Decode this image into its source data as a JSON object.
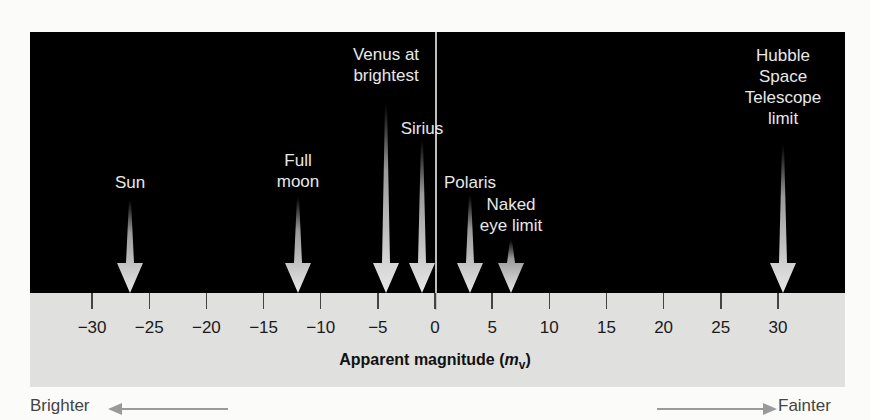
{
  "chart_data": {
    "type": "scatter",
    "title": "",
    "xlabel": "Apparent magnitude (m_v)",
    "ylabel": "",
    "xlim": [
      -33,
      35
    ],
    "ticks": [
      -30,
      -25,
      -20,
      -15,
      -10,
      -5,
      0,
      5,
      10,
      15,
      20,
      25,
      30
    ],
    "tick_labels": [
      "−30",
      "−25",
      "−20",
      "−15",
      "−10",
      "−5",
      "0",
      "5",
      "10",
      "15",
      "20",
      "25",
      "30"
    ],
    "grid": false,
    "points": [
      {
        "name": "Sun",
        "x": -26.7
      },
      {
        "name": "Full moon",
        "x": -12.6
      },
      {
        "name": "Venus at brightest",
        "x": -4.4
      },
      {
        "name": "Sirius",
        "x": -1.4
      },
      {
        "name": "Polaris",
        "x": 2.0
      },
      {
        "name": "Naked eye limit",
        "x": 6.0
      },
      {
        "name": "Hubble Space Telescope limit",
        "x": 30.0
      }
    ],
    "annotations": [
      "Brighter",
      "Fainter"
    ]
  },
  "axis": {
    "title": "Apparent magnitude (",
    "title_var": "m",
    "title_sub": "v",
    "title_end": ")"
  },
  "objects": [
    {
      "label": "Sun",
      "x_px": 130,
      "label_top": 172,
      "arrow_top": 200,
      "arrow_len": 93
    },
    {
      "label": "Full\nmoon",
      "x_px": 298,
      "label_top": 150,
      "arrow_top": 197,
      "arrow_len": 96
    },
    {
      "label": "Venus at\nbrightest",
      "x_px": 386,
      "label_top": 44,
      "arrow_top": 104,
      "arrow_len": 189
    },
    {
      "label": "Sirius",
      "x_px": 422,
      "label_top": 118,
      "arrow_top": 140,
      "arrow_len": 153
    },
    {
      "label": "Polaris",
      "x_px": 470,
      "label_top": 172,
      "arrow_top": 195,
      "arrow_len": 98
    },
    {
      "label": "Naked\neye limit",
      "x_px": 511,
      "label_top": 194,
      "arrow_top": 240,
      "arrow_len": 53
    },
    {
      "label": "Hubble\nSpace\nTelescope\nlimit",
      "x_px": 783,
      "label_top": 45,
      "arrow_top": 145,
      "arrow_len": 148
    }
  ],
  "direction": {
    "brighter": "Brighter",
    "fainter": "Fainter"
  },
  "colors": {
    "sky": "#000000",
    "band": "#e0e0de",
    "arrow": "#e6e6e6",
    "label": "#e8e8e8"
  }
}
